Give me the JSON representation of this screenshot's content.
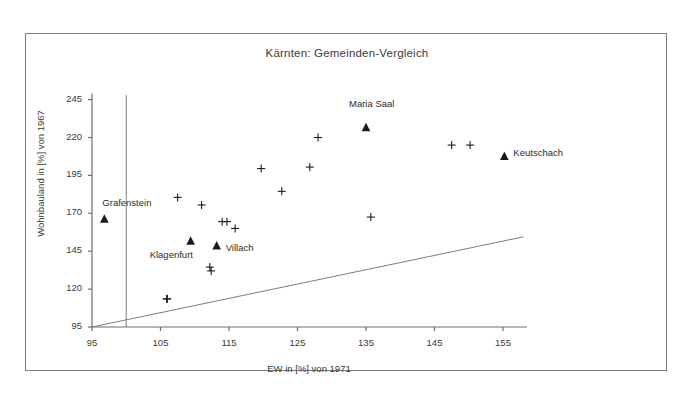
{
  "chart_data": {
    "type": "scatter",
    "title": "Kärnten: Gemeinden-Vergleich",
    "xlabel": "EW in [%] von 1971",
    "ylabel": "Wohnbauland in [%] von 1967",
    "xlim": [
      95,
      158
    ],
    "ylim": [
      95,
      250
    ],
    "xticks": [
      95,
      105,
      115,
      125,
      135,
      145,
      155
    ],
    "yticks": [
      95,
      120,
      145,
      170,
      195,
      220,
      245
    ],
    "grid": false,
    "legend": null,
    "series": [
      {
        "name": "Gemeinden (unbeschriftet)",
        "marker": "plus",
        "points": [
          {
            "x": 106.0,
            "y": 113.5
          },
          {
            "x": 105.9,
            "y": 113.6
          },
          {
            "x": 112.4,
            "y": 132.0
          },
          {
            "x": 112.2,
            "y": 134.5
          },
          {
            "x": 107.5,
            "y": 180.5
          },
          {
            "x": 111.0,
            "y": 175.5
          },
          {
            "x": 114.0,
            "y": 164.5
          },
          {
            "x": 114.7,
            "y": 164.5
          },
          {
            "x": 115.9,
            "y": 160.0
          },
          {
            "x": 119.7,
            "y": 199.5
          },
          {
            "x": 122.7,
            "y": 184.5
          },
          {
            "x": 128.0,
            "y": 220.0
          },
          {
            "x": 126.8,
            "y": 200.5
          },
          {
            "x": 135.7,
            "y": 167.5
          },
          {
            "x": 147.5,
            "y": 215.0
          },
          {
            "x": 150.2,
            "y": 215.0
          }
        ]
      },
      {
        "name": "Hervorgehobene Gemeinden",
        "marker": "triangle",
        "points": [
          {
            "x": 96.8,
            "y": 166.0,
            "label": "Grafenstein",
            "label_dx": -2,
            "label_dy": -22
          },
          {
            "x": 109.4,
            "y": 151.5,
            "label": "Klagenfurt",
            "label_dx": -41,
            "label_dy": 8
          },
          {
            "x": 113.2,
            "y": 148.5,
            "label": "Villach",
            "label_dx": 9,
            "label_dy": -4
          },
          {
            "x": 135.0,
            "y": 226.5,
            "label": "Maria Saal",
            "label_dx": -17,
            "label_dy": -30
          },
          {
            "x": 155.2,
            "y": 207.5,
            "label": "Keutschach",
            "label_dx": 9,
            "label_dy": -9
          }
        ]
      }
    ],
    "reference_lines": [
      {
        "name": "vertical-100-line",
        "type": "vertical",
        "x": 100
      },
      {
        "name": "diagonal-trend-line",
        "type": "segment",
        "x0": 95,
        "y0": 95,
        "x1": 158,
        "y1": 154.5
      }
    ]
  },
  "axis": {
    "title": "Kärnten: Gemeinden-Vergleich",
    "x_title": "EW in [%] von 1971",
    "y_title": "Wohnbauland in [%] von 1967",
    "x_tick_labels": [
      "95",
      "105",
      "115",
      "125",
      "135",
      "145",
      "155"
    ],
    "y_tick_labels": [
      "95",
      "120",
      "145",
      "170",
      "195",
      "220",
      "245"
    ]
  },
  "labels": {
    "grafenstein": "Grafenstein",
    "klagenfurt": "Klagenfurt",
    "villach": "Villach",
    "maria_saal": "Maria Saal",
    "keutschach": "Keutschach"
  },
  "colors": {
    "frame": "#7a7a7a",
    "axis": "#6e6e6e",
    "marker": "#1a1a1a",
    "text": "#2b2b2b",
    "background": "#ffffff"
  }
}
